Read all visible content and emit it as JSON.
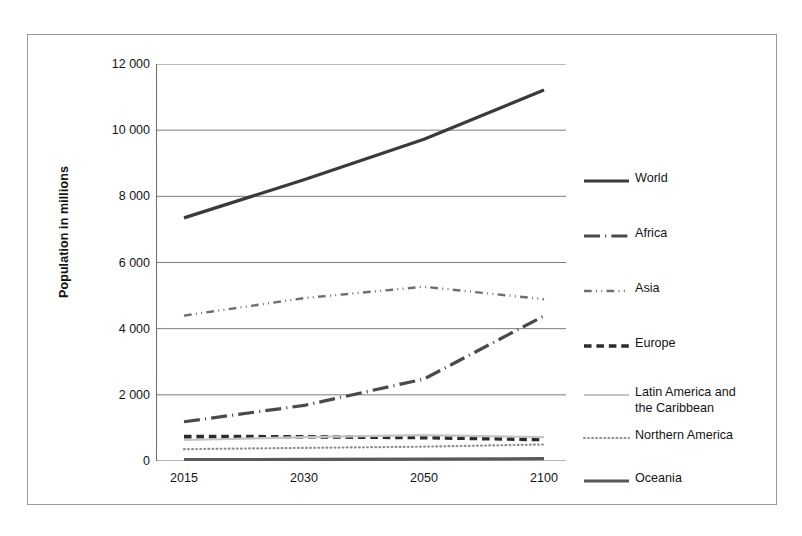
{
  "chart_data": {
    "type": "line",
    "title": "",
    "xlabel": "",
    "ylabel": "Population in millions",
    "categories": [
      "2015",
      "2030",
      "2050",
      "2100"
    ],
    "ylim": [
      0,
      12000
    ],
    "yticks": [
      0,
      2000,
      4000,
      6000,
      8000,
      10000,
      12000
    ],
    "ytick_labels": [
      "0",
      "2 000",
      "4 000",
      "6 000",
      "8 000",
      "10 000",
      "12 000"
    ],
    "grid": "horizontal",
    "legend_position": "right",
    "series": [
      {
        "name": "World",
        "values": [
          7349,
          8501,
          9725,
          11213
        ],
        "style": "solid",
        "width": 3.2,
        "color": "#3a3a3a"
      },
      {
        "name": "Africa",
        "values": [
          1186,
          1679,
          2478,
          4387
        ],
        "style": "long-dash-dot",
        "width": 3.2,
        "color": "#4a4a4a"
      },
      {
        "name": "Asia",
        "values": [
          4393,
          4923,
          5267,
          4889
        ],
        "style": "dash-dot-dot",
        "width": 2.4,
        "color": "#6e6e6e"
      },
      {
        "name": "Europe",
        "values": [
          738,
          734,
          707,
          646
        ],
        "style": "thick-dash",
        "width": 3.6,
        "color": "#2b2b2b"
      },
      {
        "name": "Latin America and\nthe Caribbean",
        "values": [
          634,
          721,
          784,
          721
        ],
        "style": "light-solid",
        "width": 2.2,
        "color": "#c4c4c4"
      },
      {
        "name": "Northern America",
        "values": [
          358,
          396,
          433,
          500
        ],
        "style": "dotted",
        "width": 2.2,
        "color": "#8e8e8e"
      },
      {
        "name": "Oceania",
        "values": [
          39,
          47,
          57,
          71
        ],
        "style": "solid",
        "width": 3.2,
        "color": "#5a5a5a"
      }
    ]
  },
  "axis": {
    "y_title": "Population in millions"
  },
  "legend": {
    "entries": [
      {
        "label": "World"
      },
      {
        "label": "Africa"
      },
      {
        "label": "Asia"
      },
      {
        "label": "Europe"
      },
      {
        "label": "Latin America and\nthe Caribbean"
      },
      {
        "label": "Northern America"
      },
      {
        "label": "Oceania"
      }
    ]
  }
}
